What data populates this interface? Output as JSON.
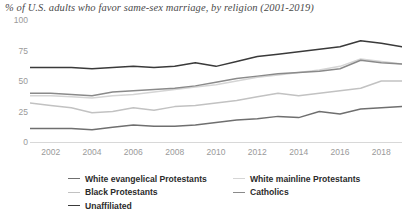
{
  "title": "% of U.S. adults who favor same-sex marriage, by religion (2001-2019)",
  "axes": {
    "y_ticks": [
      "0",
      "25",
      "50",
      "75",
      "100"
    ],
    "x_ticks": [
      "2002",
      "2004",
      "2006",
      "2008",
      "2010",
      "2012",
      "2014",
      "2016",
      "2018"
    ]
  },
  "legend": {
    "items": [
      {
        "label": "White evangelical Protestants",
        "color": "#6f6f6f"
      },
      {
        "label": "White mainline Protestants",
        "color": "#d5d5d5"
      },
      {
        "label": "Black Protestants",
        "color": "#c2c2c2"
      },
      {
        "label": "Catholics",
        "color": "#8a8a8a"
      },
      {
        "label": "Unaffiliated",
        "color": "#3a3a3a"
      }
    ]
  },
  "chart_data": {
    "type": "line",
    "title": "% of U.S. adults who favor same-sex marriage, by religion (2001-2019)",
    "xlabel": "",
    "ylabel": "",
    "xlim": [
      2001,
      2019
    ],
    "ylim": [
      0,
      100
    ],
    "grid": false,
    "legend_position": "bottom",
    "x": [
      2001,
      2002,
      2003,
      2004,
      2005,
      2006,
      2007,
      2008,
      2009,
      2010,
      2011,
      2012,
      2013,
      2014,
      2015,
      2016,
      2017,
      2018,
      2019
    ],
    "series": [
      {
        "name": "Unaffiliated",
        "color": "#3a3a3a",
        "values": [
          61,
          61,
          61,
          60,
          61,
          62,
          61,
          62,
          65,
          62,
          66,
          70,
          72,
          74,
          76,
          78,
          83,
          81,
          78
        ]
      },
      {
        "name": "Catholics",
        "color": "#8a8a8a",
        "values": [
          40,
          40,
          39,
          38,
          41,
          42,
          43,
          44,
          46,
          49,
          52,
          54,
          56,
          57,
          58,
          60,
          67,
          65,
          64
        ]
      },
      {
        "name": "White mainline Protestants",
        "color": "#d5d5d5",
        "values": [
          38,
          38,
          37,
          36,
          38,
          39,
          41,
          43,
          45,
          47,
          50,
          53,
          55,
          57,
          59,
          62,
          68,
          66,
          64
        ]
      },
      {
        "name": "Black Protestants",
        "color": "#c2c2c2",
        "values": [
          32,
          30,
          28,
          24,
          25,
          28,
          26,
          29,
          30,
          32,
          34,
          37,
          40,
          38,
          40,
          42,
          44,
          50,
          50
        ]
      },
      {
        "name": "White evangelical Protestants",
        "color": "#6f6f6f",
        "values": [
          11,
          11,
          11,
          10,
          12,
          14,
          13,
          13,
          14,
          16,
          18,
          19,
          21,
          20,
          25,
          23,
          27,
          28,
          29
        ]
      }
    ]
  }
}
